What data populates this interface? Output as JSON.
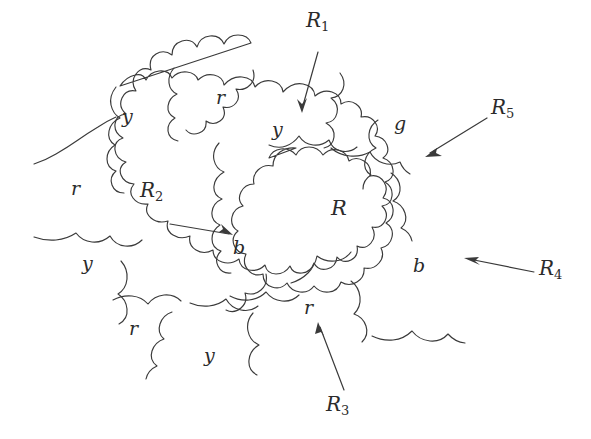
{
  "figure": {
    "type": "planar-map-coloring-diagram",
    "background_color": "#ffffff",
    "ink_color": "#3a3a3a",
    "text_color": "#2b2b2b"
  },
  "color_labels": [
    {
      "id": "c1",
      "text": "y",
      "meaning": "yellow",
      "x": 128,
      "y": 118
    },
    {
      "id": "c2",
      "text": "r",
      "meaning": "red",
      "x": 221,
      "y": 98
    },
    {
      "id": "c3",
      "text": "y",
      "meaning": "yellow",
      "x": 278,
      "y": 131
    },
    {
      "id": "c4",
      "text": "g",
      "meaning": "green",
      "x": 400,
      "y": 125
    },
    {
      "id": "c5",
      "text": "r",
      "meaning": "red",
      "x": 77,
      "y": 189
    },
    {
      "id": "c6",
      "text": "b",
      "meaning": "blue",
      "x": 238,
      "y": 249
    },
    {
      "id": "c7",
      "text": "b",
      "meaning": "blue",
      "x": 418,
      "y": 267
    },
    {
      "id": "c8",
      "text": "y",
      "meaning": "yellow",
      "x": 88,
      "y": 265
    },
    {
      "id": "c9",
      "text": "r",
      "meaning": "red",
      "x": 134,
      "y": 329
    },
    {
      "id": "c10",
      "text": "y",
      "meaning": "yellow",
      "x": 210,
      "y": 357
    },
    {
      "id": "c11",
      "text": "r",
      "meaning": "red",
      "x": 309,
      "y": 308
    }
  ],
  "region_labels": [
    {
      "id": "Rcenter",
      "text": "R",
      "x": 338,
      "y": 211
    }
  ],
  "annotations": [
    {
      "id": "R1",
      "base": "R",
      "sub": "1",
      "label_x": 314,
      "label_y": 22,
      "arrow": {
        "x1": 318,
        "y1": 52,
        "x2": 302,
        "y2": 113
      }
    },
    {
      "id": "R2",
      "base": "R",
      "sub": "2",
      "label_x": 148,
      "label_y": 192,
      "arrow": {
        "x1": 170,
        "y1": 224,
        "x2": 233,
        "y2": 234
      }
    },
    {
      "id": "R3",
      "base": "R",
      "sub": "3",
      "label_x": 333,
      "label_y": 405,
      "arrow": {
        "x1": 344,
        "y1": 390,
        "x2": 318,
        "y2": 322
      }
    },
    {
      "id": "R4",
      "base": "R",
      "sub": "4",
      "label_x": 545,
      "label_y": 269,
      "arrow": {
        "x1": 534,
        "y1": 272,
        "x2": 464,
        "y2": 258
      }
    },
    {
      "id": "R5",
      "base": "R",
      "sub": "5",
      "label_x": 497,
      "label_y": 108,
      "arrow": {
        "x1": 487,
        "y1": 118,
        "x2": 425,
        "y2": 157
      }
    }
  ],
  "legend_meaning": {
    "r": "red",
    "y": "yellow",
    "b": "blue",
    "g": "green",
    "R": "central region"
  }
}
